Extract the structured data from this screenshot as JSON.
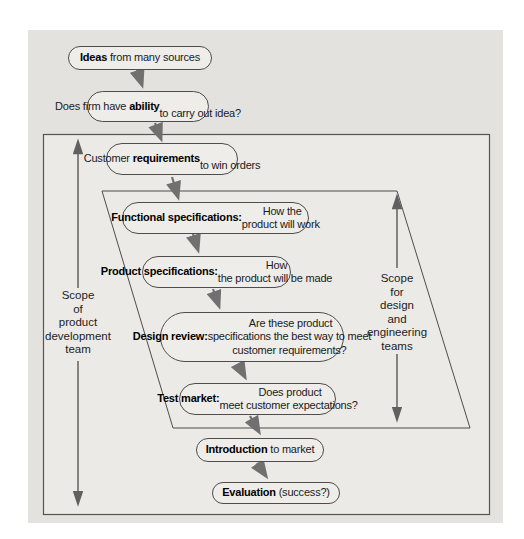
{
  "figure": {
    "background_color": "#ffffff",
    "panel_color": "#e3e2df",
    "inner_box_color": "#ebeae7",
    "node_fill": "#eeedea",
    "node_border_color": "#4d4d4d",
    "outline_color": "#555555",
    "arrow_color": "#707070",
    "text_color": "#1a1a1a",
    "nodes": [
      {
        "name": "ideas",
        "parts": [
          {
            "text": "Ideas",
            "bold": true
          },
          {
            "text": " from many sources",
            "bold": false
          }
        ]
      },
      {
        "name": "ability",
        "parts": [
          {
            "text": "Does firm have ",
            "bold": false
          },
          {
            "text": "ability",
            "bold": true
          },
          {
            "text": "\nto carry out idea?",
            "bold": false
          }
        ]
      },
      {
        "name": "customer-requirements",
        "parts": [
          {
            "text": "Customer ",
            "bold": false
          },
          {
            "text": "requirements",
            "bold": true
          },
          {
            "text": "\nto win orders",
            "bold": false
          }
        ]
      },
      {
        "name": "functional-specifications",
        "parts": [
          {
            "text": "Functional specifications:",
            "bold": true
          },
          {
            "text": " How the\nproduct will work",
            "bold": false
          }
        ]
      },
      {
        "name": "product-specifications",
        "parts": [
          {
            "text": "Product specifications:",
            "bold": true
          },
          {
            "text": " How\nthe product will be made",
            "bold": false
          }
        ]
      },
      {
        "name": "design-review",
        "parts": [
          {
            "text": "Design review:",
            "bold": true
          },
          {
            "text": " Are these product\nspecifications the best way to meet\ncustomer requirements?",
            "bold": false
          }
        ]
      },
      {
        "name": "test-market",
        "parts": [
          {
            "text": "Test market:",
            "bold": true
          },
          {
            "text": " Does product\nmeet customer expectations?",
            "bold": false
          }
        ]
      },
      {
        "name": "introduction",
        "parts": [
          {
            "text": "Introduction",
            "bold": true
          },
          {
            "text": " to market",
            "bold": false
          }
        ]
      },
      {
        "name": "evaluation",
        "parts": [
          {
            "text": "Evaluation",
            "bold": true
          },
          {
            "text": " (success?)",
            "bold": false
          }
        ]
      }
    ],
    "labels": {
      "left_scope": "Scope\nof\nproduct\ndevelopment\nteam",
      "right_scope": "Scope\nfor\ndesign\nand\nengineering\nteams"
    }
  }
}
